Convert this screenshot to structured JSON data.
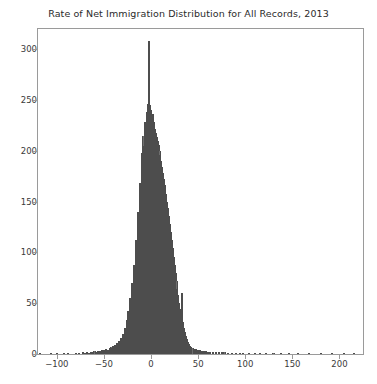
{
  "chart_data": {
    "type": "bar",
    "title": "Rate of Net Immigration Distribution for All Records, 2013",
    "subtitle": "",
    "xlabel": "",
    "ylabel": "",
    "xlim": [
      -120,
      225
    ],
    "ylim": [
      0,
      320
    ],
    "grid": false,
    "legend": null,
    "bar_color": "#6f6f6f",
    "edge_color": "#4d4d4d",
    "axis_color": "#9a9a9a",
    "text_color": "#3a3a3a",
    "background": "#ffffff",
    "xticks": [
      -100,
      -50,
      0,
      50,
      100,
      150,
      200
    ],
    "xtick_labels": [
      "−100",
      "−50",
      "0",
      "50",
      "100",
      "150",
      "200"
    ],
    "yticks": [
      0,
      50,
      100,
      150,
      200,
      250,
      300
    ],
    "ytick_labels": [
      "0",
      "50",
      "100",
      "150",
      "200",
      "250",
      "300"
    ],
    "bin_width": 2.2,
    "x": [
      -118,
      -112,
      -106,
      -100,
      -96,
      -92,
      -88,
      -84,
      -80,
      -76,
      -72,
      -70,
      -68,
      -66,
      -64,
      -62,
      -60,
      -58,
      -56,
      -54,
      -52,
      -50,
      -48,
      -46,
      -44,
      -43,
      -42,
      -41,
      -40,
      -39,
      -38,
      -37,
      -36,
      -35,
      -34,
      -33,
      -32,
      -31,
      -30,
      -29,
      -28,
      -27,
      -26,
      -25,
      -24,
      -23,
      -22,
      -21,
      -20,
      -19,
      -18,
      -17,
      -16,
      -15,
      -14,
      -13,
      -12,
      -11,
      -10,
      -9,
      -8,
      -7,
      -6,
      -5,
      -4,
      -3,
      -2,
      -1,
      0,
      1,
      2,
      3,
      4,
      5,
      6,
      7,
      8,
      9,
      10,
      11,
      12,
      13,
      14,
      15,
      16,
      17,
      18,
      19,
      20,
      21,
      22,
      23,
      24,
      25,
      26,
      27,
      28,
      29,
      30,
      31,
      32,
      33,
      34,
      35,
      36,
      37,
      38,
      39,
      40,
      41,
      42,
      44,
      46,
      48,
      50,
      52,
      54,
      56,
      58,
      60,
      63,
      66,
      69,
      72,
      75,
      78,
      82,
      86,
      90,
      94,
      98,
      104,
      110,
      116,
      122,
      130,
      138,
      146,
      156,
      168,
      180,
      192,
      205,
      215
    ],
    "values": [
      1,
      0,
      1,
      1,
      0,
      1,
      1,
      0,
      1,
      1,
      2,
      1,
      2,
      1,
      2,
      2,
      3,
      2,
      3,
      3,
      4,
      4,
      5,
      4,
      6,
      5,
      7,
      6,
      8,
      7,
      9,
      8,
      11,
      9,
      13,
      11,
      16,
      14,
      20,
      17,
      26,
      22,
      33,
      28,
      42,
      36,
      55,
      47,
      70,
      60,
      88,
      78,
      112,
      98,
      140,
      125,
      168,
      152,
      198,
      180,
      215,
      205,
      228,
      222,
      238,
      246,
      308,
      245,
      240,
      232,
      236,
      228,
      222,
      218,
      214,
      210,
      206,
      200,
      196,
      190,
      184,
      178,
      172,
      166,
      158,
      150,
      144,
      136,
      128,
      120,
      112,
      104,
      96,
      88,
      80,
      72,
      64,
      58,
      50,
      44,
      38,
      60,
      32,
      26,
      22,
      18,
      15,
      12,
      10,
      8,
      7,
      6,
      5,
      5,
      4,
      4,
      3,
      3,
      3,
      2,
      2,
      2,
      2,
      2,
      2,
      2,
      1,
      1,
      1,
      1,
      1,
      1,
      1,
      1,
      1,
      1,
      1,
      1,
      1,
      1,
      1,
      1,
      1,
      1
    ]
  }
}
